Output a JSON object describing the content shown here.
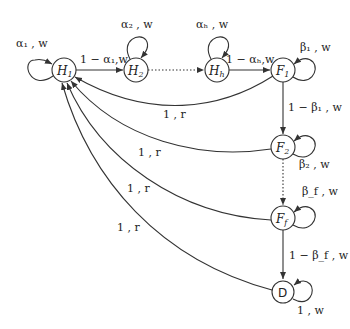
{
  "diagram": {
    "type": "state-transition",
    "nodes": [
      {
        "id": "H1",
        "label": "H",
        "sub": "1",
        "x": 64,
        "y": 70
      },
      {
        "id": "H2",
        "label": "H",
        "sub": "2",
        "x": 136,
        "y": 70
      },
      {
        "id": "Hh",
        "label": "H",
        "sub": "h",
        "x": 217,
        "y": 70
      },
      {
        "id": "F1",
        "label": "F",
        "sub": "1",
        "x": 283,
        "y": 70
      },
      {
        "id": "F2",
        "label": "F",
        "sub": "2",
        "x": 283,
        "y": 147
      },
      {
        "id": "Ff",
        "label": "F",
        "sub": "f",
        "x": 283,
        "y": 218
      },
      {
        "id": "D",
        "label": "D",
        "sub": "",
        "x": 283,
        "y": 292
      }
    ],
    "edges": [
      {
        "from": "H1",
        "to": "H1",
        "label": "α₁ , w"
      },
      {
        "from": "H1",
        "to": "H2",
        "label": "1 − α₁,w"
      },
      {
        "from": "H2",
        "to": "H2",
        "label": "α₂ , w"
      },
      {
        "from": "H2",
        "to": "Hh",
        "label": "",
        "style": "dotted"
      },
      {
        "from": "Hh",
        "to": "Hh",
        "label": "αₕ , w"
      },
      {
        "from": "Hh",
        "to": "F1",
        "label": "1 − αₕ,w"
      },
      {
        "from": "F1",
        "to": "F1",
        "label": "β₁ , w"
      },
      {
        "from": "F1",
        "to": "F2",
        "label": "1 − β₁ , w"
      },
      {
        "from": "F1",
        "to": "H1",
        "label": "1 , r"
      },
      {
        "from": "F2",
        "to": "F2",
        "label": "β₂ , w"
      },
      {
        "from": "F2",
        "to": "Ff",
        "label": "",
        "style": "dotted"
      },
      {
        "from": "F2",
        "to": "H1",
        "label": "1 , r"
      },
      {
        "from": "Ff",
        "to": "Ff",
        "label": "β_f , w"
      },
      {
        "from": "Ff",
        "to": "D",
        "label": "1 − β_f , w"
      },
      {
        "from": "Ff",
        "to": "H1",
        "label": "1 , r"
      },
      {
        "from": "D",
        "to": "D",
        "label": "1 , w"
      },
      {
        "from": "D",
        "to": "H1",
        "label": "1 , r"
      }
    ]
  },
  "labels": {
    "h1_self": "α₁ , w",
    "h1_h2": "1 − α₁,w",
    "h2_self": "α₂ , w",
    "hh_self": "αₕ , w",
    "hh_f1": "1 − αₕ,w",
    "f1_self": "β₁ , w",
    "f1_f2": "1 − β₁ , w",
    "f1_h1": "1 , r",
    "f2_self": "β₂ , w",
    "f2_h1": "1 , r",
    "ff_self": "β_f , w",
    "ff_d": "1 − β_f , w",
    "ff_h1": "1 , r",
    "d_self": "1 , w",
    "d_h1": "1 , r"
  },
  "nodes": {
    "h1": "H",
    "h1_sub": "1",
    "h2": "H",
    "h2_sub": "2",
    "hh": "H",
    "hh_sub": "h",
    "f1": "F",
    "f1_sub": "1",
    "f2": "F",
    "f2_sub": "2",
    "ff": "F",
    "ff_sub": "f",
    "d": "D"
  }
}
